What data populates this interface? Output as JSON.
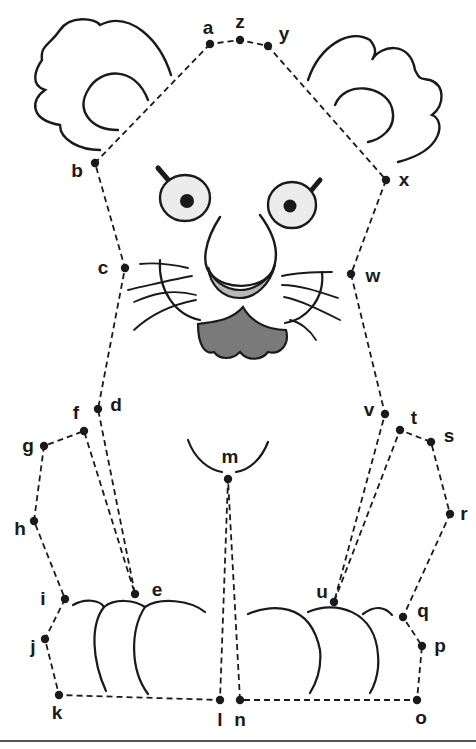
{
  "colors": {
    "ink": "#1a1a1a",
    "nose_fill": "#b8b8b8",
    "mouth_fill": "#7a7a7a",
    "eye_fill": "#ececec",
    "paper": "#ffffff"
  },
  "dots": [
    {
      "label": "a",
      "x": 210,
      "y": 44
    },
    {
      "label": "z",
      "x": 240,
      "y": 40
    },
    {
      "label": "y",
      "x": 268,
      "y": 46
    },
    {
      "label": "b",
      "x": 95,
      "y": 163
    },
    {
      "label": "x",
      "x": 386,
      "y": 180
    },
    {
      "label": "c",
      "x": 125,
      "y": 268
    },
    {
      "label": "w",
      "x": 351,
      "y": 274
    },
    {
      "label": "d",
      "x": 98,
      "y": 409
    },
    {
      "label": "v",
      "x": 385,
      "y": 414
    },
    {
      "label": "f",
      "x": 84,
      "y": 431
    },
    {
      "label": "t",
      "x": 400,
      "y": 430
    },
    {
      "label": "s",
      "x": 431,
      "y": 442
    },
    {
      "label": "g",
      "x": 44,
      "y": 446
    },
    {
      "label": "m",
      "x": 228,
      "y": 479
    },
    {
      "label": "r",
      "x": 450,
      "y": 514
    },
    {
      "label": "h",
      "x": 34,
      "y": 521
    },
    {
      "label": "e",
      "x": 135,
      "y": 594
    },
    {
      "label": "u",
      "x": 334,
      "y": 602
    },
    {
      "label": "i",
      "x": 65,
      "y": 599
    },
    {
      "label": "q",
      "x": 403,
      "y": 617
    },
    {
      "label": "j",
      "x": 45,
      "y": 639
    },
    {
      "label": "p",
      "x": 422,
      "y": 646
    },
    {
      "label": "k",
      "x": 59,
      "y": 695
    },
    {
      "label": "l",
      "x": 220,
      "y": 700
    },
    {
      "label": "n",
      "x": 240,
      "y": 700
    },
    {
      "label": "o",
      "x": 417,
      "y": 700
    }
  ],
  "sequence": [
    "a",
    "b",
    "c",
    "d",
    "e",
    "f",
    "g",
    "h",
    "i",
    "j",
    "k",
    "l",
    "m",
    "n",
    "o",
    "p",
    "q",
    "r",
    "s",
    "t",
    "u",
    "v",
    "w",
    "x",
    "y",
    "z",
    "a"
  ]
}
